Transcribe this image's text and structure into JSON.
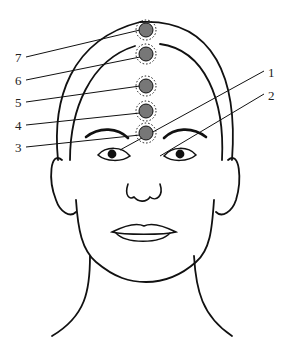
{
  "diagram": {
    "points": [
      {
        "label": "1",
        "x": 146,
        "y": 132,
        "label_x": 268,
        "label_y": 66
      },
      {
        "label": "2",
        "x": 180,
        "y": 154,
        "label_x": 268,
        "label_y": 89
      },
      {
        "label": "3",
        "x": 146,
        "y": 133,
        "label_x": 15,
        "label_y": 141
      },
      {
        "label": "4",
        "x": 146,
        "y": 111,
        "label_x": 15,
        "label_y": 119
      },
      {
        "label": "5",
        "x": 146,
        "y": 87,
        "label_x": 15,
        "label_y": 96
      },
      {
        "label": "6",
        "x": 146,
        "y": 54,
        "label_x": 15,
        "label_y": 74
      },
      {
        "label": "7",
        "x": 146,
        "y": 30,
        "label_x": 15,
        "label_y": 51
      }
    ],
    "marker_color": "#777777",
    "line_color": "#111111"
  }
}
